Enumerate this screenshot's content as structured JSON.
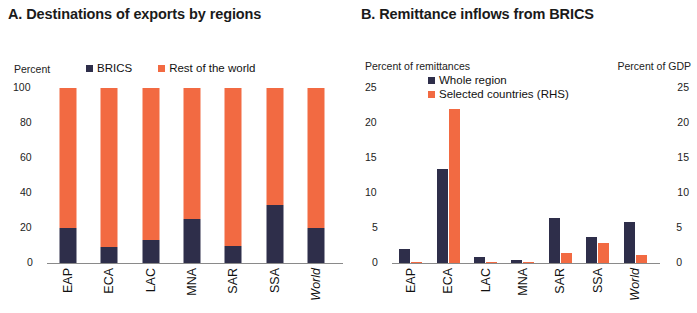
{
  "panels": {
    "a": {
      "title": "A. Destinations of exports by regions",
      "axis_caption": "Percent",
      "legend": [
        {
          "label": "BRICS",
          "color": "#2e2e4a"
        },
        {
          "label": "Rest of the world",
          "color": "#f26a42"
        }
      ]
    },
    "b": {
      "title": "B. Remittance inflows from BRICS",
      "left_axis_caption": "Percent of remittances",
      "right_axis_caption": "Percent of GDP",
      "legend": [
        {
          "label": "Whole region",
          "color": "#2e2e4a"
        },
        {
          "label": "Selected countries (RHS)",
          "color": "#f26a42"
        }
      ]
    }
  },
  "colors": {
    "brics_navy": "#2e2e4a",
    "rest_orange": "#f26a42",
    "axis_line": "#8a8a8a",
    "text": "#1a1a1a"
  },
  "chart_data": [
    {
      "type": "bar",
      "id": "panel-a",
      "title": "A. Destinations of exports by regions",
      "subtype": "stacked-100",
      "xlabel": "",
      "ylabel": "Percent",
      "ylim": [
        0,
        100
      ],
      "yticks": [
        0,
        20,
        40,
        60,
        80,
        100
      ],
      "grid": false,
      "legend_position": "top",
      "categories": [
        "EAP",
        "ECA",
        "LAC",
        "MNA",
        "SAR",
        "SSA",
        "World"
      ],
      "series": [
        {
          "name": "BRICS",
          "color": "#2e2e4a",
          "values": [
            20,
            9,
            13,
            25,
            10,
            33,
            20
          ]
        },
        {
          "name": "Rest of the world",
          "color": "#f26a42",
          "values": [
            80,
            91,
            87,
            75,
            90,
            67,
            80
          ]
        }
      ]
    },
    {
      "type": "bar",
      "id": "panel-b",
      "title": "B. Remittance inflows from BRICS",
      "subtype": "grouped-dual-axis",
      "xlabel": "",
      "ylabel": "Percent of remittances",
      "y2label": "Percent of GDP",
      "ylim": [
        0,
        25
      ],
      "y2lim": [
        0,
        25
      ],
      "yticks": [
        0,
        5,
        10,
        15,
        20,
        25
      ],
      "y2ticks": [
        0,
        5,
        10,
        15,
        20,
        25
      ],
      "grid": false,
      "legend_position": "top",
      "categories": [
        "EAP",
        "ECA",
        "LAC",
        "MNA",
        "SAR",
        "SSA",
        "World"
      ],
      "series": [
        {
          "name": "Whole region",
          "axis": "left",
          "color": "#2e2e4a",
          "values": [
            2.0,
            13.5,
            0.8,
            0.4,
            6.5,
            3.7,
            5.9
          ]
        },
        {
          "name": "Selected countries (RHS)",
          "axis": "right",
          "color": "#f26a42",
          "values": [
            0.2,
            22.0,
            0.1,
            0.1,
            1.5,
            2.9,
            1.2
          ]
        }
      ]
    }
  ],
  "ticks_a": [
    "100",
    "80",
    "60",
    "40",
    "20",
    "0"
  ],
  "ticks_b_left": [
    "25",
    "20",
    "15",
    "10",
    "5",
    "0"
  ],
  "ticks_b_right": [
    "25",
    "20",
    "15",
    "10",
    "5",
    "0"
  ],
  "categories": [
    "EAP",
    "ECA",
    "LAC",
    "MNA",
    "SAR",
    "SSA",
    "World"
  ]
}
